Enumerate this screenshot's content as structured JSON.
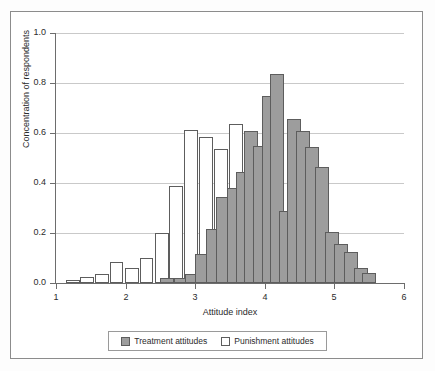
{
  "chart_data": {
    "type": "bar",
    "subtype": "overlaid-histogram",
    "title": "",
    "xlabel": "Attitude index",
    "ylabel": "Concentration of respondents",
    "xlim": [
      1,
      6
    ],
    "ylim": [
      0.0,
      1.0
    ],
    "xticks": [
      "1",
      "2",
      "3",
      "4",
      "5",
      "6"
    ],
    "xtick_values": [
      1,
      2,
      3,
      4,
      5,
      6
    ],
    "yticks": [
      "0.0",
      "0.2",
      "0.4",
      "0.6",
      "0.8",
      "1.0"
    ],
    "ytick_values": [
      0.0,
      0.2,
      0.4,
      0.6,
      0.8,
      1.0
    ],
    "grid": true,
    "grid_axis": "y",
    "bin_width": 0.2,
    "legend_position": "below",
    "colors": {
      "treatment_fill": "#9d9d9d",
      "punishment_fill": "#ffffff",
      "bar_edge": "#5d5d5d",
      "gridline": "#c9c9c9",
      "axis": "#6d6d6d",
      "frame": "#8c8c8c",
      "text": "#2b2b2b",
      "background": "#ffffff"
    },
    "series": [
      {
        "name": "Treatment attitudes",
        "fill": "#9d9d9d",
        "bins": [
          {
            "x": 2.5,
            "value": 0.02
          },
          {
            "x": 2.7,
            "value": 0.02
          },
          {
            "x": 2.85,
            "value": 0.035
          },
          {
            "x": 3.0,
            "value": 0.115
          },
          {
            "x": 3.15,
            "value": 0.215
          },
          {
            "x": 3.3,
            "value": 0.345
          },
          {
            "x": 3.45,
            "value": 0.38
          },
          {
            "x": 3.58,
            "value": 0.445
          },
          {
            "x": 3.7,
            "value": 0.61
          },
          {
            "x": 3.83,
            "value": 0.55
          },
          {
            "x": 3.96,
            "value": 0.75
          },
          {
            "x": 4.08,
            "value": 0.835
          },
          {
            "x": 4.2,
            "value": 0.29
          },
          {
            "x": 4.32,
            "value": 0.655
          },
          {
            "x": 4.45,
            "value": 0.61
          },
          {
            "x": 4.58,
            "value": 0.545
          },
          {
            "x": 4.72,
            "value": 0.465
          },
          {
            "x": 4.86,
            "value": 0.205
          },
          {
            "x": 5.0,
            "value": 0.155
          },
          {
            "x": 5.14,
            "value": 0.125
          },
          {
            "x": 5.28,
            "value": 0.06
          },
          {
            "x": 5.4,
            "value": 0.04
          }
        ]
      },
      {
        "name": "Punishment attitudes",
        "fill": "#ffffff",
        "bins": [
          {
            "x": 1.14,
            "value": 0.012
          },
          {
            "x": 1.35,
            "value": 0.025
          },
          {
            "x": 1.56,
            "value": 0.035
          },
          {
            "x": 1.77,
            "value": 0.085
          },
          {
            "x": 1.99,
            "value": 0.062
          },
          {
            "x": 2.2,
            "value": 0.1
          },
          {
            "x": 2.42,
            "value": 0.2
          },
          {
            "x": 2.63,
            "value": 0.39
          },
          {
            "x": 2.84,
            "value": 0.612
          },
          {
            "x": 3.05,
            "value": 0.585
          },
          {
            "x": 3.27,
            "value": 0.538
          },
          {
            "x": 3.48,
            "value": 0.635
          },
          {
            "x": 3.69,
            "value": 0.29
          },
          {
            "x": 4.11,
            "value": 0.29
          },
          {
            "x": 4.32,
            "value": 0.105
          },
          {
            "x": 4.53,
            "value": 0.205
          },
          {
            "x": 4.75,
            "value": 0.142
          },
          {
            "x": 4.96,
            "value": 0.035
          }
        ]
      }
    ]
  },
  "legend": {
    "entries": [
      {
        "label": "Treatment attitudes",
        "swatch": "treatment"
      },
      {
        "label": "Punishment attitudes",
        "swatch": "punishment"
      }
    ]
  }
}
